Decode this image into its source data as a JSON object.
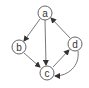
{
  "diagram": {
    "type": "directed-graph",
    "nodes": [
      {
        "id": "a",
        "label": "a",
        "cx": 45,
        "cy": 13
      },
      {
        "id": "b",
        "label": "b",
        "cx": 19,
        "cy": 47
      },
      {
        "id": "c",
        "label": "c",
        "cx": 47,
        "cy": 73
      },
      {
        "id": "d",
        "label": "d",
        "cx": 75,
        "cy": 44
      }
    ],
    "edges": [
      {
        "from": "a",
        "to": "b",
        "style": "straight"
      },
      {
        "from": "a",
        "to": "c",
        "style": "straight"
      },
      {
        "from": "b",
        "to": "c",
        "style": "straight"
      },
      {
        "from": "c",
        "to": "d",
        "style": "straight"
      },
      {
        "from": "d",
        "to": "a",
        "style": "straight"
      },
      {
        "from": "d",
        "to": "c",
        "style": "curved"
      }
    ],
    "colors": {
      "stroke": "#555555",
      "text": "#333333",
      "background": "#ffffff"
    }
  }
}
